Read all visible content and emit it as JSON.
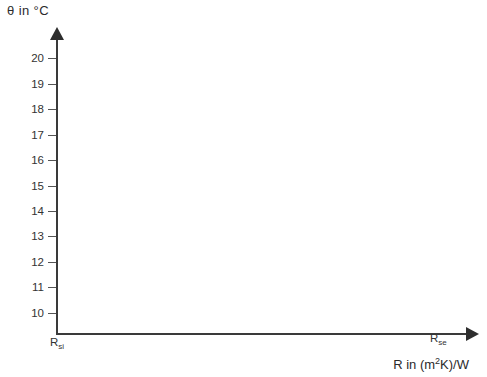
{
  "chart_data": {
    "type": "line",
    "title": "",
    "ylabel": "θ  in °C",
    "xlabel_prefix": "R in (m",
    "xlabel_sup": "2",
    "xlabel_suffix": "K)/W",
    "xlabel_full": "R in (m2K)/W",
    "y_ticks": [
      20,
      19,
      18,
      17,
      16,
      15,
      14,
      13,
      12,
      11,
      10
    ],
    "ylim": [
      9.2,
      20.8
    ],
    "grid": false,
    "legend": null,
    "series": [],
    "x_axis_endpoints": {
      "left_label_base": "R",
      "left_label_sub": "si",
      "right_label_base": "R",
      "right_label_sub": "se"
    },
    "annotations": [],
    "note": "Empty plotting template: temperature profile versus thermal resistance, no data plotted"
  },
  "colors": {
    "background": "#ffffff",
    "axis": "#3a3a3a",
    "text": "#2b2b2b",
    "tick": "#555555"
  }
}
